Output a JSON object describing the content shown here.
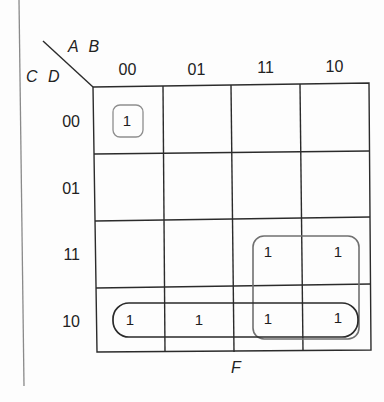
{
  "kmap": {
    "title": "F",
    "row_variables": "C D",
    "col_variables": "A B",
    "col_headers": [
      "00",
      "01",
      "11",
      "10"
    ],
    "row_headers": [
      "00",
      "01",
      "11",
      "10"
    ],
    "cells": [
      [
        "1",
        "",
        "",
        ""
      ],
      [
        "",
        "",
        "",
        ""
      ],
      [
        "",
        "",
        "1",
        "1"
      ],
      [
        "1",
        "1",
        "1",
        "1"
      ]
    ],
    "groups": [
      {
        "name": "single-minterm-0000",
        "cells": [
          [
            0,
            0
          ]
        ],
        "color": "#8a8a8a"
      },
      {
        "name": "row-10-quad",
        "cells": [
          [
            3,
            0
          ],
          [
            3,
            1
          ],
          [
            3,
            2
          ],
          [
            3,
            3
          ]
        ],
        "color": "#2a2a2a"
      },
      {
        "name": "square-quad-A-C",
        "cells": [
          [
            2,
            2
          ],
          [
            2,
            3
          ],
          [
            3,
            2
          ],
          [
            3,
            3
          ]
        ],
        "color": "#707070"
      }
    ]
  },
  "colors": {
    "grid_line": "#2b2b2b",
    "background": "#fdfdfd",
    "margin_line": "#7a7a7a"
  }
}
